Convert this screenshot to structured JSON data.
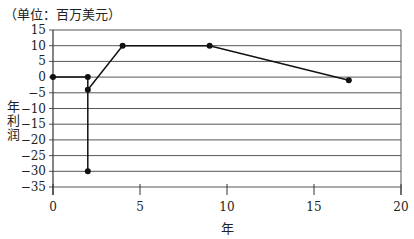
{
  "chart_data": {
    "type": "line",
    "title": "",
    "unit_label": "（单位：百万美元）",
    "xlabel": "年",
    "ylabel": "年利润",
    "xlim": [
      0,
      20
    ],
    "ylim": [
      -35,
      15
    ],
    "x_ticks": [
      0,
      5,
      10,
      15,
      20
    ],
    "y_ticks": [
      15,
      10,
      5,
      0,
      -5,
      -10,
      -15,
      -20,
      -25,
      -30,
      -35
    ],
    "grid": "horizontal",
    "series": [
      {
        "name": "年利润",
        "points": [
          {
            "x": 0,
            "y": 0
          },
          {
            "x": 2,
            "y": 0
          },
          {
            "x": 2,
            "y": -30
          },
          {
            "x": 2,
            "y": -4
          },
          {
            "x": 4,
            "y": 10
          },
          {
            "x": 9,
            "y": 10
          },
          {
            "x": 17,
            "y": -1
          }
        ]
      }
    ],
    "markers": [
      {
        "x": 0,
        "y": 0
      },
      {
        "x": 2,
        "y": 0
      },
      {
        "x": 2,
        "y": -4
      },
      {
        "x": 2,
        "y": -30
      },
      {
        "x": 4,
        "y": 10
      },
      {
        "x": 9,
        "y": 10
      },
      {
        "x": 17,
        "y": -1
      }
    ]
  }
}
